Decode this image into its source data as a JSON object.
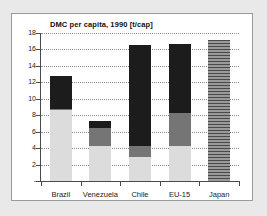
{
  "chart_data": {
    "type": "bar",
    "subtype": "stacked-bar",
    "title": "DMC per capita, 1990 [t/cap]",
    "xlabel": "",
    "ylabel": "",
    "ylim": [
      0,
      18
    ],
    "ytick_values": [
      18,
      16,
      14,
      12,
      10,
      8,
      6,
      4,
      2,
      0
    ],
    "ytick_labels": [
      "18",
      "16",
      "14",
      "12",
      "10",
      "8",
      "6",
      "4",
      "2",
      "-"
    ],
    "grid": "horizontal-dotted",
    "legend": "none",
    "categories": [
      "Brazil",
      "Venezuela",
      "Chile",
      "EU-15",
      "Japan"
    ],
    "series": [
      {
        "name": "segment-low",
        "color": "#dcdcdc",
        "values": [
          8.6,
          4.2,
          2.9,
          4.3,
          0
        ]
      },
      {
        "name": "segment-mid",
        "color": "#757575",
        "values": [
          0.1,
          2.2,
          1.3,
          4.0,
          0
        ]
      },
      {
        "name": "segment-high",
        "color": "#1c1c1c",
        "values": [
          4.1,
          0.9,
          12.3,
          8.4,
          0
        ]
      },
      {
        "name": "segment-striped",
        "color": "#6f6f6f",
        "values": [
          0,
          0,
          0,
          0,
          17.2
        ]
      }
    ],
    "totals": [
      12.8,
      7.3,
      16.5,
      16.7,
      17.2
    ]
  }
}
